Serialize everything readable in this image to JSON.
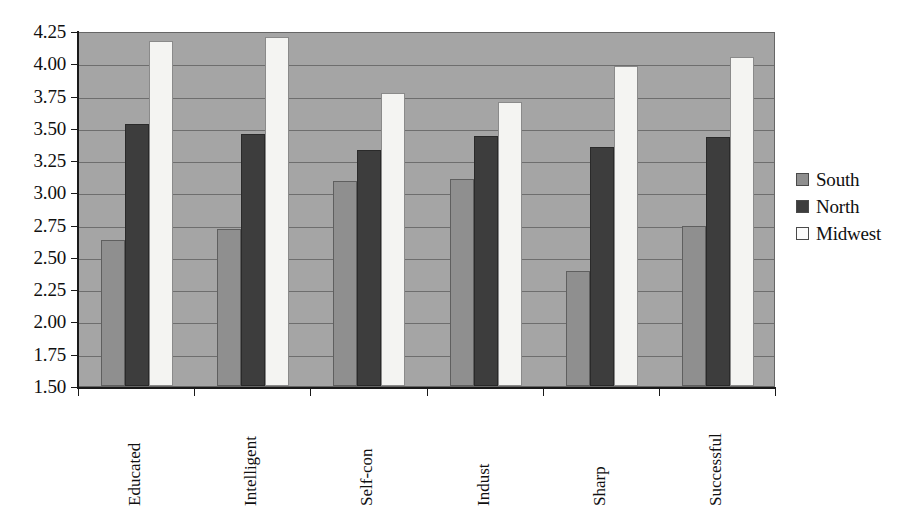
{
  "chart_data": {
    "type": "bar",
    "title": "",
    "xlabel": "",
    "ylabel": "",
    "ylim": [
      1.5,
      4.25
    ],
    "ytick_labels": [
      "4.25",
      "4.00",
      "3.75",
      "3.50",
      "3.25",
      "3.00",
      "2.75",
      "2.50",
      "2.25",
      "2.00",
      "1.75",
      "1.50"
    ],
    "ytick_values": [
      4.25,
      4.0,
      3.75,
      3.5,
      3.25,
      3.0,
      2.75,
      2.5,
      2.25,
      2.0,
      1.75,
      1.5
    ],
    "grid": true,
    "grid_axis": "y",
    "legend_position": "right",
    "categories": [
      "Educated",
      "Intelligent",
      "Self-con",
      "Indust",
      "Sharp",
      "Successful"
    ],
    "series": [
      {
        "name": "South",
        "color": "#8f8f8f",
        "values": [
          2.63,
          2.72,
          3.09,
          3.1,
          2.39,
          2.74
        ]
      },
      {
        "name": "North",
        "color": "#3d3d3d",
        "values": [
          3.53,
          3.45,
          3.33,
          3.44,
          3.35,
          3.43
        ]
      },
      {
        "name": "Midwest",
        "color": "#f4f4f2",
        "values": [
          4.17,
          4.2,
          3.77,
          3.7,
          3.98,
          4.05
        ]
      }
    ]
  },
  "legend": {
    "items": [
      {
        "label": "South",
        "swatch": "south"
      },
      {
        "label": "North",
        "swatch": "north"
      },
      {
        "label": "Midwest",
        "swatch": "midwest"
      }
    ]
  },
  "colors": {
    "plot_background": "#a5a5a5",
    "gridline": "#6e6e6e",
    "axis": "#1a1a1a",
    "text": "#101010",
    "south": "#8f8f8f",
    "north": "#3d3d3d",
    "midwest": "#f4f4f2"
  }
}
